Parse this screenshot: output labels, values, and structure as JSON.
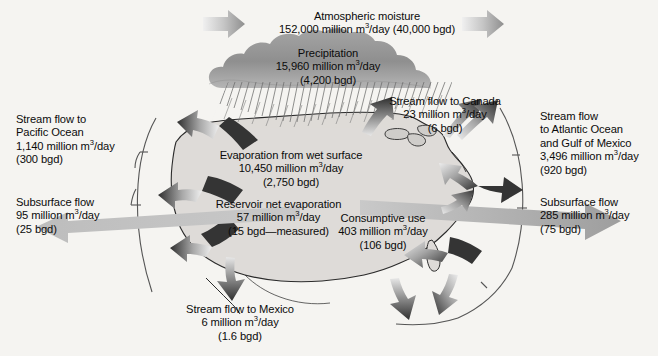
{
  "diagram": {
    "units_note": "m3/day and bgd (billion gallons per day)",
    "colors": {
      "background": "#f7f6f4",
      "land_fill": "#dedbd8",
      "cloud": "#9d9d9d",
      "arrow_dark": "#3a3a3a",
      "arrow_light": "#d9d9d9",
      "outline": "#2b2b2b",
      "text": "#0b0b0b"
    }
  },
  "flows": {
    "atmospheric_moisture": {
      "name": "Atmospheric moisture",
      "line1": "Atmospheric moisture",
      "line2": "152,000 million m3/day (40,000 bgd)",
      "value_metric": "152,000 million m3/day",
      "value_imperial": "40,000 bgd",
      "value_number": 152000,
      "bgd_number": 40000
    },
    "precipitation": {
      "name": "Precipitation",
      "line1": "Precipitation",
      "line2": "15,960 million m3/day",
      "line3": "(4,200 bgd)",
      "value_number": 15960,
      "bgd_number": 4200
    },
    "stream_flow_pacific": {
      "name": "Stream flow to Pacific Ocean",
      "line1": "Stream flow to",
      "line2": "Pacific Ocean",
      "line3": "1,140 million m3/day",
      "line4": "(300 bgd)",
      "value_number": 1140,
      "bgd_number": 300
    },
    "subsurface_flow_west": {
      "name": "Subsurface flow west",
      "line1": "Subsurface flow",
      "line2": "95 million m3/day",
      "line3": "(25 bgd)",
      "value_number": 95,
      "bgd_number": 25
    },
    "stream_flow_canada": {
      "name": "Stream flow to Canada",
      "line1": "Stream flow to Canada",
      "line2": "23 million m3/day",
      "line3": "(6 bgd)",
      "value_number": 23,
      "bgd_number": 6
    },
    "stream_flow_atlantic": {
      "name": "Stream flow to Atlantic Ocean and Gulf of Mexico",
      "line1": "Stream flow",
      "line2": "to Atlantic Ocean",
      "line3": "and Gulf of Mexico",
      "line4": "3,496 million m3/day",
      "line5": "(920 bgd)",
      "value_number": 3496,
      "bgd_number": 920
    },
    "subsurface_flow_east": {
      "name": "Subsurface flow east",
      "line1": "Subsurface flow",
      "line2": "285 million m3/day",
      "line3": "(75 bgd)",
      "value_number": 285,
      "bgd_number": 75
    },
    "evaporation_wet_surface": {
      "name": "Evaporation from wet surface",
      "line1": "Evaporation from wet surface",
      "line2": "10,450 million m3/day",
      "line3": "(2,750 bgd)",
      "value_number": 10450,
      "bgd_number": 2750
    },
    "reservoir_net_evaporation": {
      "name": "Reservoir net evaporation",
      "line1": "Reservoir net evaporation",
      "line2": "57 million m3/day",
      "line3": "(15 bgd—measured)",
      "value_number": 57,
      "bgd_number": 15
    },
    "consumptive_use": {
      "name": "Consumptive use",
      "line1": "Consumptive use",
      "line2": "403 million m3/day",
      "line3": "(106 bgd)",
      "value_number": 403,
      "bgd_number": 106
    },
    "stream_flow_mexico": {
      "name": "Stream flow to Mexico",
      "line1": "Stream flow to Mexico",
      "line2": "6 million m3/day",
      "line3": "(1.6 bgd)",
      "value_number": 6,
      "bgd_number": 1.6
    }
  },
  "icons": {
    "wind_arrow_left": "arrow-right-icon",
    "wind_arrow_right": "arrow-right-icon",
    "cloud": "cloud-icon",
    "rain": "rain-hatching-icon",
    "bracket_left": "bracket-arc-icon",
    "bracket_right": "bracket-arc-icon"
  }
}
